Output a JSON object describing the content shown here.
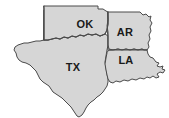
{
  "map": {
    "name": "south-central-us-states-map",
    "type": "outline-map",
    "background_color": "#ffffff",
    "state_fill_color": "#d6d6d6",
    "state_border_color": "#4a4a4a",
    "label_color": "#1a1a1a",
    "states": [
      {
        "code": "OK",
        "name": "Oklahoma",
        "label_x": 85,
        "label_y": 25,
        "outline": "M44,6 L98,6 L98,9 L103,9 L106,11 L108,12 L108,24 L107,30 L105,34 L100,36 L96,34 L92,35 L88,34 L84,36 L80,35 L76,37 L72,36 L68,38 L64,37 L60,39 L56,38 L52,39 L48,40 L44,40 L44,10 Z"
      },
      {
        "code": "AR",
        "name": "Arkansas",
        "label_x": 125,
        "label_y": 33,
        "outline": "M108,12 L140,12 L143,15 L146,14 L149,17 L151,16 L150,20 L152,23 L150,27 L151,31 L149,35 L150,39 L148,43 L149,47 L147,50 L144,50 L142,49 L138,50 L134,49 L130,50 L126,49 L122,50 L118,49 L113,50 L109,49 L108,45 L108,32 L107,26 L108,20 Z"
      },
      {
        "code": "LA",
        "name": "Louisiana",
        "label_x": 126,
        "label_y": 61,
        "outline": "M109,50 L147,50 L148,54 L150,57 L153,58 L156,62 L159,63 L157,66 L160,67 L163,66 L162,69 L165,70 L163,73 L160,72 L157,74 L159,77 L156,78 L153,76 L150,78 L147,77 L144,79 L140,78 L136,80 L132,79 L128,81 L124,80 L120,82 L116,81 L113,83 L110,82 L108,79 L107,75 L106,70 L105,64 L106,58 L107,53 Z"
      },
      {
        "code": "TX",
        "name": "Texas",
        "label_x": 73,
        "label_y": 68,
        "outline": "M44,10 L44,40 L40,41 L36,41 L32,42 L28,43 L24,43 L21,44 L18,45 L15,47 L14,50 L16,53 L17,57 L19,60 L22,62 L26,63 L30,65 L33,68 L36,71 L38,75 L40,79 L43,82 L46,84 L49,86 L51,89 L53,92 L56,94 L59,96 L62,98 L65,101 L68,104 L71,107 L73,110 L75,113 L77,116 L79,117 L82,115 L84,112 L86,108 L88,105 L91,102 L94,100 L97,97 L100,95 L103,92 L105,89 L107,86 L108,82 L108,79 L107,74 L106,68 L105,62 L106,56 L107,50 L108,45 L108,36 L105,34 L100,36 L96,34 L92,35 L88,34 L84,36 L80,35 L76,37 L72,36 L68,38 L64,37 L60,39 L56,38 L52,39 L48,40 L44,40 Z"
      }
    ],
    "internal_borders": [
      "M44,40 L48,40 L52,39 L56,38 L60,39 L64,37 L68,38 L72,36 L76,37 L80,35 L84,36 L88,34 L92,35 L96,34 L100,36 L105,34 L107,30 L108,24 L108,12",
      "M108,12 L108,24 L107,30 L108,36 L108,45 L108,50",
      "M109,50 L113,50 L118,49 L122,50 L126,49 L130,50 L134,49 L138,50 L142,49 L144,50 L147,50",
      "M44,6 L44,40"
    ]
  }
}
